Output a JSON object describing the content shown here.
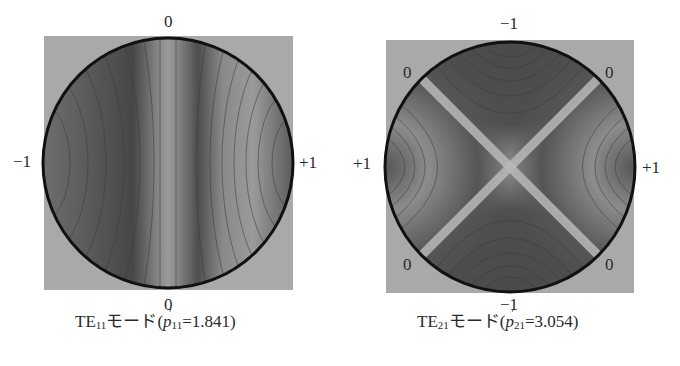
{
  "figure": {
    "panels": [
      {
        "id": "te11",
        "mode_prefix": "TE",
        "mode_sub": "11",
        "mode_suffix": "モード",
        "param_open": "(",
        "param_var": "p",
        "param_prime": "′",
        "param_sub": "11",
        "param_eq": "=1.841)",
        "labels": {
          "top": "0",
          "bottom": "0",
          "left": "−1",
          "right": "+1"
        }
      },
      {
        "id": "te21",
        "mode_prefix": "TE",
        "mode_sub": "21",
        "mode_suffix": "モード",
        "param_open": "(",
        "param_var": "p",
        "param_prime": "′",
        "param_sub": "21",
        "param_eq": "=3.054)",
        "labels": {
          "top": "−1",
          "bottom": "−1",
          "left": "+1",
          "right": "+1",
          "top_left": "0",
          "top_right": "0",
          "bottom_left": "0",
          "bottom_right": "0"
        }
      }
    ],
    "colors": {
      "background_square": "#a9a9a9",
      "circle_border": "#111111",
      "dark_field": "#4a4a4a",
      "light_field": "#b4b4b4"
    }
  }
}
